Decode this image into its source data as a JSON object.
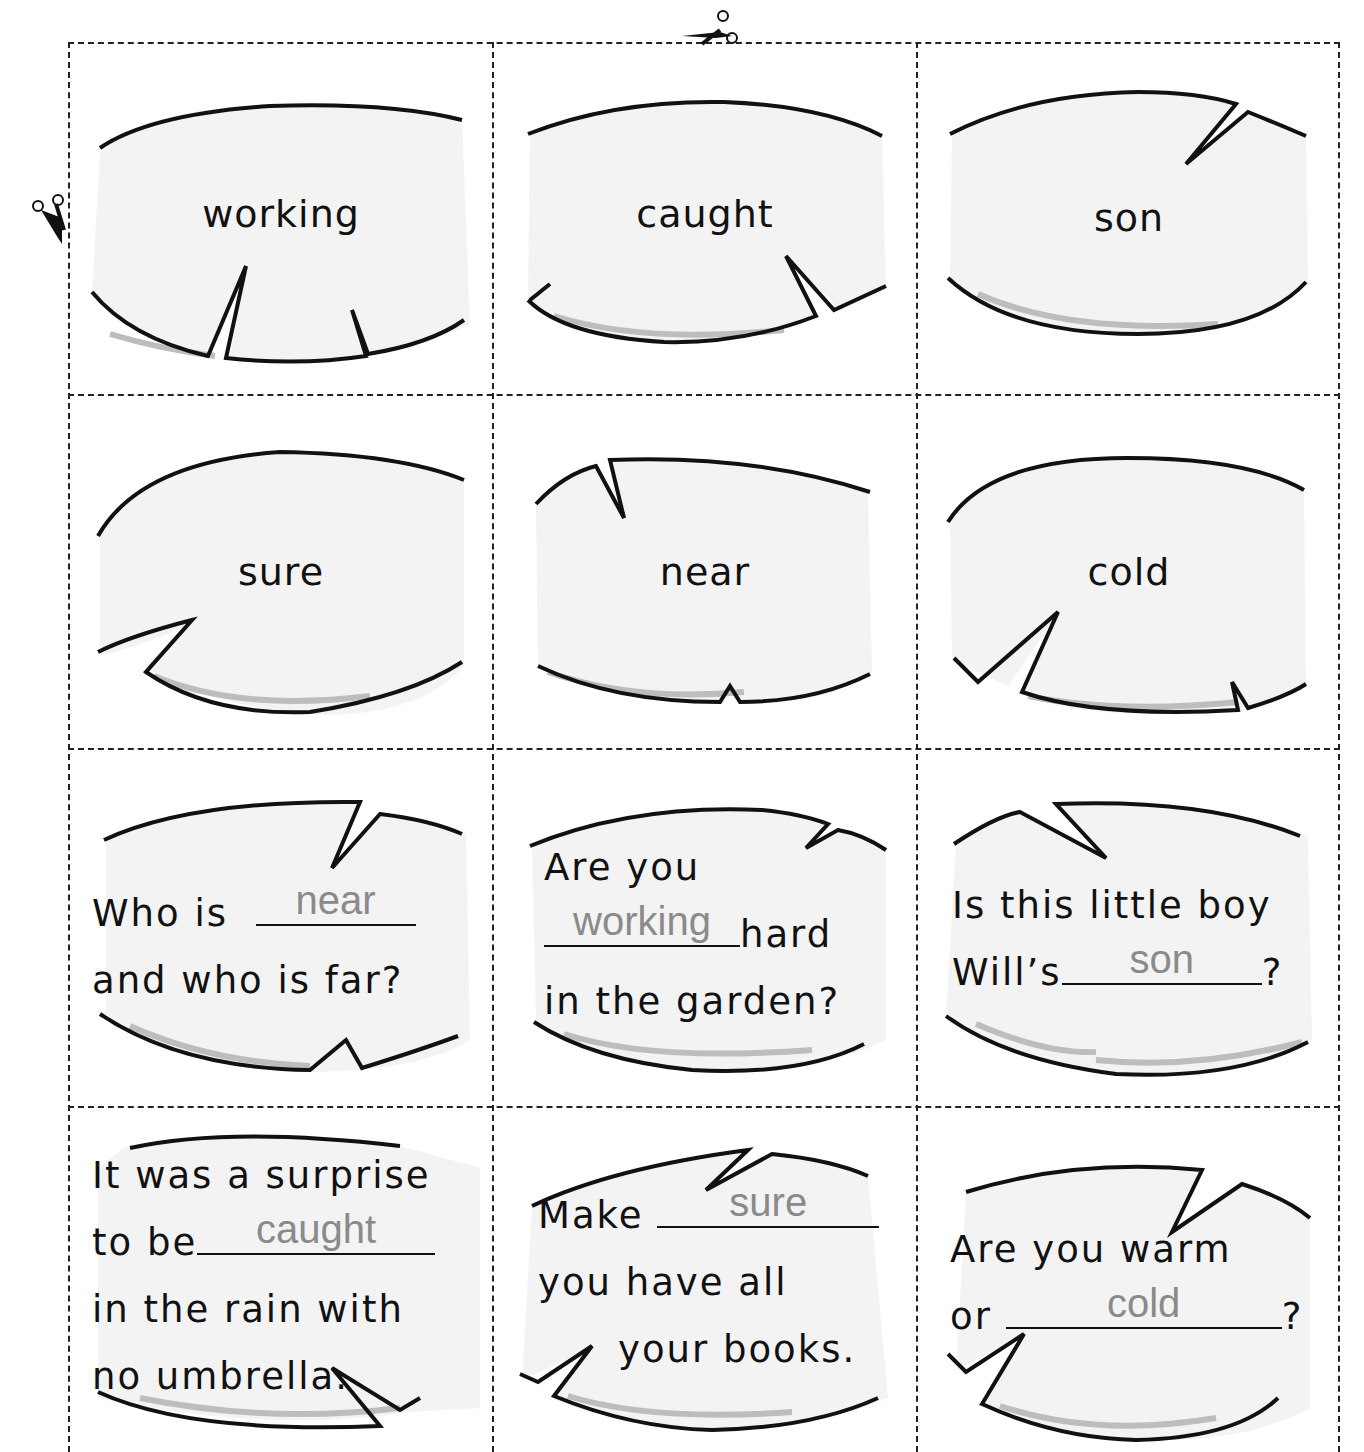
{
  "worksheet": {
    "type": "cut-out word cards",
    "grid": {
      "columns": 3,
      "rows": 4
    },
    "cut_marks": [
      {
        "position": "top",
        "icon": "scissors-icon"
      },
      {
        "position": "left",
        "icon": "scissors-icon"
      }
    ],
    "word_cards": [
      {
        "word": "working"
      },
      {
        "word": "caught"
      },
      {
        "word": "son"
      },
      {
        "word": "sure"
      },
      {
        "word": "near"
      },
      {
        "word": "cold"
      }
    ],
    "sentence_cards": [
      {
        "lines": [
          "Who is",
          "and who is far?"
        ],
        "before_blank": "Who is",
        "after_blank": "",
        "answer": "near"
      },
      {
        "lines": [
          "Are you",
          "hard",
          "in the garden?"
        ],
        "line1": "Are you",
        "after_blank": "hard",
        "line3": "in the garden?",
        "answer": "working"
      },
      {
        "line1": "Is this little boy",
        "before_blank": "Will’s",
        "after_blank": "?",
        "answer": "son"
      },
      {
        "line1": "It was a surprise",
        "before_blank": "to be",
        "line3": "in the rain with",
        "line4": "no umbrella.",
        "answer": "caught"
      },
      {
        "before_blank": "Make",
        "line2": "you have all",
        "line3": "your books.",
        "answer": "sure"
      },
      {
        "line1": "Are you warm",
        "before_blank": "or",
        "after_blank": "?",
        "answer": "cold"
      }
    ],
    "line2_card0": "and who is far?",
    "colors": {
      "ink": "#111111",
      "answer_text": "#8a8a8a",
      "rock_fill": "#f3f3f3",
      "rock_shadow": "#bdbdbd",
      "cut_line": "#222222"
    }
  }
}
